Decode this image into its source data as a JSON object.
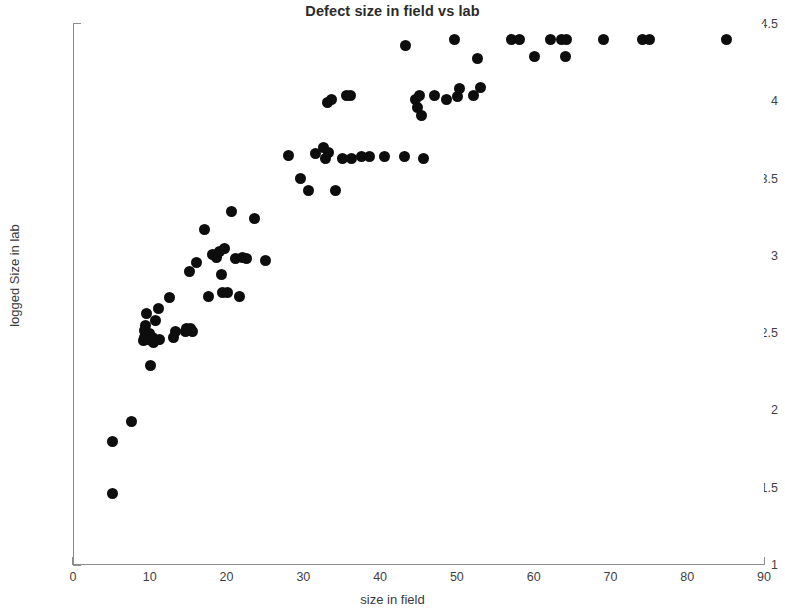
{
  "chart_data": {
    "type": "scatter",
    "title": "Defect size in field vs lab",
    "xlabel": "size in field",
    "ylabel": "logged Size in lab",
    "xlim": [
      0,
      90
    ],
    "ylim": [
      1,
      4.5
    ],
    "xticks": [
      0,
      10,
      20,
      30,
      40,
      50,
      60,
      70,
      80,
      90
    ],
    "yticks": [
      1,
      1.5,
      2,
      2.5,
      3,
      3.5,
      4,
      4.5
    ],
    "x_minor_tick_step": 2,
    "y_minor_tick_step": 0.1,
    "grid": false,
    "legend": null,
    "marker": {
      "shape": "circle",
      "color": "#0d0d0d",
      "size_px": 11,
      "filled": true
    },
    "series": [
      {
        "name": "defects",
        "x": [
          5.0,
          5.0,
          7.5,
          9.0,
          9.2,
          9.2,
          9.3,
          9.4,
          9.5,
          9.6,
          9.8,
          10.0,
          10.1,
          10.2,
          10.4,
          10.6,
          11.0,
          11.2,
          12.5,
          13.0,
          13.2,
          14.5,
          14.7,
          15.0,
          15.2,
          15.4,
          16.0,
          17.0,
          17.5,
          18.0,
          18.5,
          19.0,
          19.2,
          19.4,
          19.6,
          20.0,
          20.5,
          21.0,
          21.5,
          22.0,
          22.5,
          23.5,
          25.0,
          28.0,
          29.5,
          30.5,
          31.5,
          32.5,
          32.8,
          33.0,
          33.2,
          33.5,
          34.0,
          35.0,
          35.5,
          36.0,
          36.2,
          37.5,
          38.5,
          40.5,
          43.0,
          43.2,
          44.5,
          44.8,
          45.0,
          45.2,
          45.5,
          47.0,
          48.5,
          49.5,
          50.0,
          50.2,
          52.0,
          52.5,
          53.0,
          57.0,
          58.0,
          60.0,
          62.0,
          63.5,
          64.0,
          64.2,
          69.0,
          74.0,
          75.0,
          85.0
        ],
        "y": [
          1.46,
          1.8,
          1.93,
          2.45,
          2.47,
          2.52,
          2.55,
          2.63,
          2.46,
          2.48,
          2.5,
          2.29,
          2.45,
          2.47,
          2.44,
          2.58,
          2.66,
          2.46,
          2.73,
          2.47,
          2.51,
          2.51,
          2.53,
          2.9,
          2.53,
          2.51,
          2.96,
          3.17,
          2.74,
          3.01,
          2.99,
          3.03,
          2.88,
          2.76,
          3.05,
          2.76,
          3.29,
          2.98,
          2.74,
          2.99,
          2.98,
          3.24,
          2.97,
          3.65,
          3.5,
          3.42,
          3.66,
          3.7,
          3.63,
          3.99,
          3.67,
          4.01,
          3.42,
          3.63,
          4.04,
          4.04,
          3.63,
          3.64,
          3.64,
          3.64,
          3.64,
          4.36,
          4.01,
          3.96,
          4.04,
          3.91,
          3.63,
          4.04,
          4.01,
          4.4,
          4.03,
          4.08,
          4.04,
          4.28,
          4.09,
          4.4,
          4.4,
          4.29,
          4.4,
          4.4,
          4.29,
          4.4,
          4.4,
          4.4,
          4.4,
          4.4
        ]
      }
    ]
  },
  "axes": {
    "y_tick_labels": [
      "4.5",
      "4",
      "3.5",
      "3",
      "2.5",
      "2",
      "1.5",
      "1"
    ],
    "x_tick_labels": [
      "0",
      "10",
      "20",
      "30",
      "40",
      "50",
      "60",
      "70",
      "80",
      "90"
    ]
  }
}
